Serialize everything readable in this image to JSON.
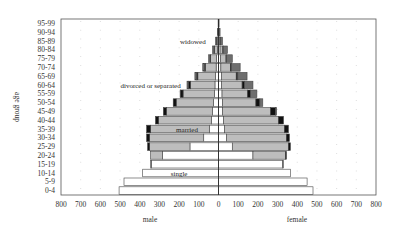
{
  "chart_data": {
    "type": "bar",
    "subtype": "population-pyramid-stacked",
    "title": "",
    "xlabel_left": "male",
    "xlabel_right": "female",
    "ylabel": "age group",
    "xlim": [
      -800,
      800
    ],
    "xticks": [
      800,
      700,
      600,
      500,
      400,
      300,
      200,
      100,
      0,
      100,
      200,
      300,
      400,
      500,
      600,
      700,
      800
    ],
    "grid": "vertical dotted",
    "categories": [
      "0-4",
      "5-9",
      "10-14",
      "15-19",
      "20-24",
      "25-29",
      "30-34",
      "35-39",
      "40-44",
      "45-49",
      "50-54",
      "55-59",
      "60-64",
      "65-69",
      "70-74",
      "75-79",
      "80-84",
      "85-89",
      "90-94",
      "95-99"
    ],
    "segments": [
      "single",
      "married",
      "divorced or separated",
      "widowed"
    ],
    "segment_colors": {
      "single": "#ffffff",
      "married": "#bdbdbd",
      "divorced or separated": "#111111",
      "widowed": "#6e6e6e"
    },
    "male": {
      "single": [
        505,
        480,
        385,
        340,
        285,
        145,
        75,
        45,
        35,
        30,
        25,
        20,
        18,
        15,
        12,
        10,
        6,
        4,
        2,
        1
      ],
      "married": [
        0,
        0,
        0,
        5,
        60,
        205,
        275,
        300,
        270,
        235,
        190,
        160,
        125,
        90,
        55,
        30,
        15,
        5,
        1,
        0
      ],
      "divorced or separated": [
        0,
        0,
        0,
        0,
        0,
        10,
        15,
        20,
        15,
        15,
        15,
        12,
        10,
        7,
        5,
        3,
        2,
        1,
        0,
        0
      ],
      "widowed": [
        0,
        0,
        0,
        0,
        0,
        0,
        0,
        0,
        0,
        0,
        0,
        3,
        7,
        8,
        8,
        7,
        7,
        5,
        2,
        1
      ]
    },
    "female": {
      "single": [
        480,
        450,
        365,
        325,
        175,
        70,
        40,
        30,
        25,
        20,
        20,
        18,
        15,
        15,
        12,
        10,
        8,
        5,
        2,
        1
      ],
      "married": [
        0,
        0,
        0,
        5,
        165,
        285,
        305,
        305,
        280,
        245,
        170,
        130,
        105,
        75,
        48,
        28,
        14,
        5,
        1,
        0
      ],
      "divorced or separated": [
        0,
        0,
        0,
        0,
        5,
        10,
        15,
        20,
        25,
        25,
        20,
        15,
        12,
        8,
        5,
        3,
        2,
        1,
        0,
        0
      ],
      "widowed": [
        0,
        0,
        0,
        0,
        0,
        0,
        0,
        0,
        0,
        5,
        15,
        32,
        43,
        47,
        45,
        29,
        21,
        9,
        5,
        2
      ]
    },
    "annotations": [
      {
        "text": "widowed",
        "x": -130,
        "age_group": "85-89"
      },
      {
        "text": "divorced or separated",
        "x": -345,
        "age_group": "60-64"
      },
      {
        "text": "married",
        "x": -160,
        "age_group": "35-39"
      },
      {
        "text": "single",
        "x": -200,
        "age_group": "10-14"
      }
    ]
  }
}
